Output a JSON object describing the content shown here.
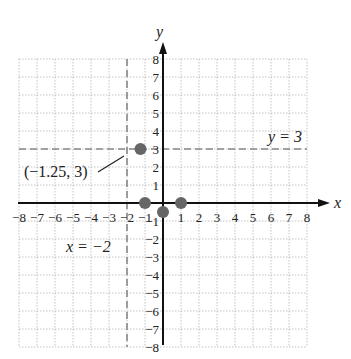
{
  "chart_data": {
    "type": "scatter",
    "title": "",
    "xlabel": "x",
    "ylabel": "y",
    "xlim": [
      -8,
      8
    ],
    "ylim": [
      -8,
      8
    ],
    "grid": true,
    "x_ticks": [
      "-8",
      "-7",
      "-6",
      "-5",
      "-4",
      "-3",
      "-2",
      "-1",
      "1",
      "2",
      "3",
      "4",
      "5",
      "6",
      "7",
      "8"
    ],
    "y_ticks": [
      "8",
      "7",
      "6",
      "5",
      "4",
      "3",
      "2",
      "1",
      "-1",
      "-2",
      "-3",
      "-4",
      "-5",
      "-6",
      "-7",
      "-8"
    ],
    "points": [
      {
        "x": -1.25,
        "y": 3
      },
      {
        "x": -1,
        "y": 0
      },
      {
        "x": 0,
        "y": -0.5
      },
      {
        "x": 1,
        "y": 0
      }
    ],
    "lines": [
      {
        "type": "horizontal",
        "value": 3,
        "label": "y = 3",
        "style": "dashed"
      },
      {
        "type": "vertical",
        "value": -2,
        "label": "x = −2",
        "style": "dashed"
      }
    ],
    "annotations": [
      {
        "text": "(−1.25, 3)",
        "points_to": {
          "x": -1.25,
          "y": 3
        }
      }
    ]
  },
  "labels": {
    "x_axis": "x",
    "y_axis": "y",
    "hline": "y = 3",
    "vline": "x = −2",
    "point": "(−1.25, 3)"
  }
}
